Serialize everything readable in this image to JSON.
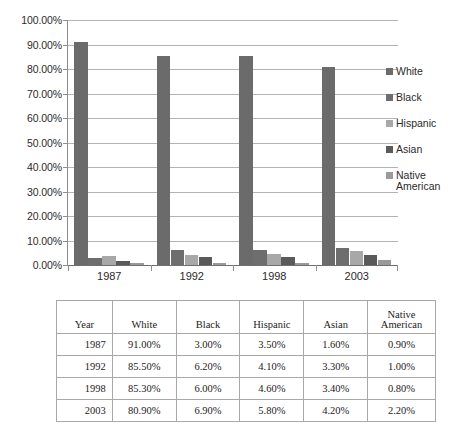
{
  "chart_data": {
    "type": "bar",
    "title": "",
    "xlabel": "",
    "ylabel": "",
    "categories": [
      "1987",
      "1992",
      "1998",
      "2003"
    ],
    "series": [
      {
        "name": "White",
        "values": [
          91.0,
          85.5,
          85.3,
          80.9
        ],
        "color": "#6b6b6b"
      },
      {
        "name": "Black",
        "values": [
          3.0,
          6.2,
          6.0,
          6.9
        ],
        "color": "#6e6e6e"
      },
      {
        "name": "Hispanic",
        "values": [
          3.5,
          4.1,
          4.6,
          5.8
        ],
        "color": "#a8a8a8"
      },
      {
        "name": "Asian",
        "values": [
          1.6,
          3.3,
          3.4,
          4.2
        ],
        "color": "#5a5a5a"
      },
      {
        "name": "Native American",
        "values": [
          0.9,
          1.0,
          0.8,
          2.2
        ],
        "color": "#9a9a9a"
      }
    ],
    "ylim": [
      0,
      100
    ],
    "ytick_labels": [
      "0.00%",
      "10.00%",
      "20.00%",
      "30.00%",
      "40.00%",
      "50.00%",
      "60.00%",
      "70.00%",
      "80.00%",
      "90.00%",
      "100.00%"
    ],
    "ytick_values": [
      0,
      10,
      20,
      30,
      40,
      50,
      60,
      70,
      80,
      90,
      100
    ],
    "grid": true,
    "legend_position": "right",
    "value_suffix": "%"
  },
  "legend": {
    "items": [
      {
        "label": "White",
        "color": "#6b6b6b"
      },
      {
        "label": "Black",
        "color": "#6e6e6e"
      },
      {
        "label": "Hispanic",
        "color": "#a8a8a8"
      },
      {
        "label": "Asian",
        "color": "#5a5a5a"
      },
      {
        "label": "Native\nAmerican",
        "color": "#9a9a9a"
      }
    ]
  },
  "table": {
    "headers": [
      "Year",
      "White",
      "Black",
      "Hispanic",
      "Asian",
      "Native\nAmerican"
    ],
    "rows": [
      {
        "year": "1987",
        "white": "91.00%",
        "black": "3.00%",
        "hispanic": "3.50%",
        "asian": "1.60%",
        "native": "0.90%"
      },
      {
        "year": "1992",
        "white": "85.50%",
        "black": "6.20%",
        "hispanic": "4.10%",
        "asian": "3.30%",
        "native": "1.00%"
      },
      {
        "year": "1998",
        "white": "85.30%",
        "black": "6.00%",
        "hispanic": "4.60%",
        "asian": "3.40%",
        "native": "0.80%"
      },
      {
        "year": "2003",
        "white": "80.90%",
        "black": "6.90%",
        "hispanic": "5.80%",
        "asian": "4.20%",
        "native": "2.20%"
      }
    ]
  }
}
